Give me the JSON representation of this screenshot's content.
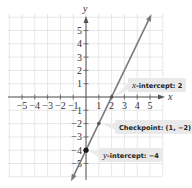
{
  "chart_data": {
    "type": "line",
    "title": "",
    "xlabel": "x",
    "ylabel": "y",
    "xlim": [
      -5,
      5
    ],
    "ylim": [
      -5,
      5
    ],
    "grid": true,
    "x_ticks": [
      -5,
      -4,
      -3,
      -2,
      -1,
      1,
      2,
      3,
      4,
      5
    ],
    "y_ticks": [
      5,
      4,
      3,
      2,
      1,
      -1,
      -2,
      -3,
      -4,
      -5
    ],
    "x_tick_labels": [
      "−5",
      "−4",
      "−3",
      "−2",
      "−1",
      "1",
      "2",
      "3",
      "4",
      "5"
    ],
    "y_tick_labels": [
      "5",
      "4",
      "3",
      "2",
      "1",
      "−1",
      "−2",
      "−3",
      "−4",
      "−5"
    ],
    "series": [
      {
        "name": "y = 2x − 4",
        "slope": 2,
        "intercept": -4,
        "x": [
          -1,
          0,
          1,
          2,
          5
        ],
        "y": [
          -6,
          -4,
          -2,
          0,
          6
        ],
        "color": "#7a7a7a",
        "arrows_both_ends": true
      }
    ],
    "points": [
      {
        "x": 2,
        "y": 0,
        "name": "x-intercept"
      },
      {
        "x": 1,
        "y": -2,
        "name": "checkpoint"
      },
      {
        "x": 0,
        "y": -4,
        "name": "y-intercept"
      }
    ],
    "annotations": [
      {
        "italic_prefix": "x",
        "text": "-intercept: 2",
        "target": [
          2,
          0
        ]
      },
      {
        "italic_prefix": "",
        "text": "Checkpoint: (1, −2)",
        "target": [
          1,
          -2
        ]
      },
      {
        "italic_prefix": "y",
        "text": "-intercept: −4",
        "target": [
          0,
          -4
        ]
      }
    ]
  },
  "axes": {
    "x_label": "x",
    "y_label": "y"
  },
  "colors": {
    "grid": "#dcdcdc",
    "axis": "#555555",
    "line": "#7a7a7a",
    "point": "#1a1a1a",
    "callout_bg": "#e9e9e9"
  }
}
